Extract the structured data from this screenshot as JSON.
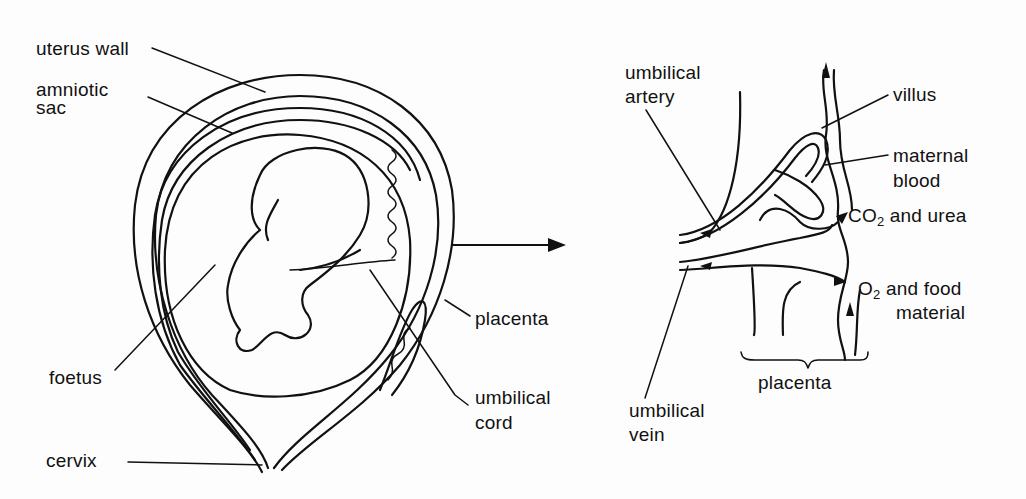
{
  "figure": {
    "left_panel": {
      "title": "Foetus in uterus",
      "labels": {
        "uterus_wall": "uterus wall",
        "amniotic_sac_1": "amniotic",
        "amniotic_sac_2": "sac",
        "foetus": "foetus",
        "cervix": "cervix",
        "placenta": "placenta",
        "umbilical_cord_1": "umbilical",
        "umbilical_cord_2": "cord"
      }
    },
    "right_panel": {
      "title": "Placenta detail",
      "labels": {
        "umbilical_artery_1": "umbilical",
        "umbilical_artery_2": "artery",
        "villus": "villus",
        "maternal_blood_1": "maternal",
        "maternal_blood_2": "blood",
        "co2_prefix": "CO",
        "co2_sub": "2",
        "co2_suffix": " and urea",
        "o2_prefix": "O",
        "o2_sub": "2",
        "o2_suffix": " and food",
        "o2_line2": "material",
        "placenta": "placenta",
        "umbilical_vein_1": "umbilical",
        "umbilical_vein_2": "vein"
      }
    },
    "connector": "arrow-right"
  }
}
